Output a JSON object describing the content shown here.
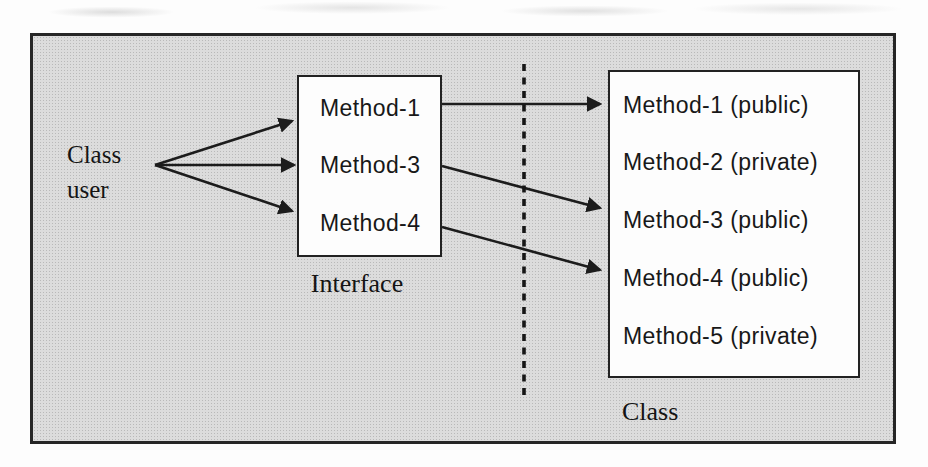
{
  "figure": {
    "type": "textbook-oop-encapsulation-diagram",
    "colors": {
      "panel_background": "#dcdcdc",
      "box_fill": "#fdfdfd",
      "line": "#1c1c1c",
      "text": "#181818"
    }
  },
  "class_user": {
    "line1": "Class",
    "line2": "user"
  },
  "interface_box": {
    "caption": "Interface",
    "methods": [
      "Method-1",
      "Method-3",
      "Method-4"
    ]
  },
  "class_box": {
    "caption": "Class",
    "methods": [
      "Method-1 (public)",
      "Method-2 (private)",
      "Method-3 (public)",
      "Method-4 (public)",
      "Method-5 (private)"
    ]
  }
}
